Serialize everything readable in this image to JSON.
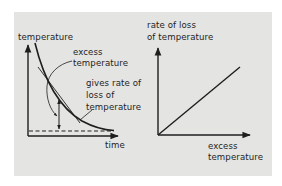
{
  "figure": {
    "background_color": "#e4e4e2",
    "ink_color": "#1e1e1e"
  },
  "left_graph": {
    "y_axis_label": "temperature",
    "x_axis_label": "time",
    "curve_annotation": {
      "line1": "excess",
      "line2": "temperature"
    },
    "tangent_annotation": {
      "line1": "gives rate of",
      "line2": "loss of",
      "line3": "temperature"
    },
    "curve_type": "exponential decay toward ambient (dashed)",
    "elements": [
      "cooling curve",
      "tangent line",
      "dashed ambient level",
      "double-headed excess arrow"
    ]
  },
  "right_graph": {
    "y_axis_label": {
      "line1": "rate of loss",
      "line2": "of temperature"
    },
    "x_axis_label": {
      "line1": "excess",
      "line2": "temperature"
    },
    "line_type": "straight line through origin (proportional)"
  }
}
